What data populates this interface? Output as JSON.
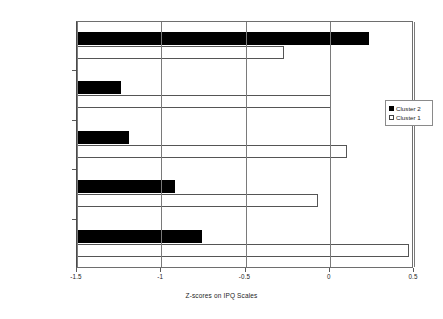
{
  "chart_data": {
    "type": "bar",
    "orientation": "horizontal",
    "title": "",
    "xlabel": "Z-scores on IPQ Scales",
    "ylabel": "",
    "xlim": [
      -1.5,
      0.5
    ],
    "xticks": [
      -1.5,
      -1,
      -0.5,
      0,
      0.5
    ],
    "xticklabels": [
      "-1.5",
      "-1",
      "-0.5",
      "0",
      "0.5"
    ],
    "grid": true,
    "grid_axis": "x",
    "legend_position": "right",
    "categories": [
      "Cure/Control",
      "Consequences",
      "Duration",
      "Internal/self-blame",
      "Identity"
    ],
    "series": [
      {
        "name": "Cluster 2",
        "color": "#000000",
        "style": "filled",
        "values": [
          0.23,
          -1.24,
          -1.19,
          -0.92,
          -0.76
        ]
      },
      {
        "name": "Cluster 1",
        "color": "#ffffff",
        "style": "hollow",
        "values": [
          -0.27,
          0.01,
          0.1,
          -0.07,
          0.47
        ]
      }
    ]
  },
  "legend": {
    "entries": [
      {
        "label": "Cluster 2",
        "swatch": "filled-square-icon"
      },
      {
        "label": "Cluster 1",
        "swatch": "hollow-square-icon"
      }
    ]
  }
}
